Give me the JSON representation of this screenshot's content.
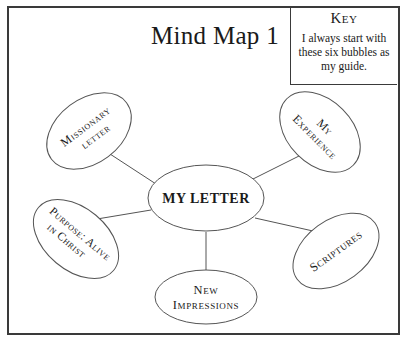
{
  "title": "Mind Map 1",
  "key": {
    "heading": "Key",
    "text": "I always start with these six bubbles as my guide."
  },
  "center_node": {
    "label": "MY LETTER"
  },
  "nodes": [
    {
      "id": "missionary",
      "line1": "Missionary",
      "line2": "letter"
    },
    {
      "id": "experience",
      "line1": "My",
      "line2": "Experience"
    },
    {
      "id": "purpose",
      "line1": "Purpose: Alive",
      "line2": "in Christ"
    },
    {
      "id": "scriptures",
      "line1": "Scriptures",
      "line2": ""
    },
    {
      "id": "impressions",
      "line1": "New",
      "line2": "Impressions"
    }
  ],
  "colors": {
    "stroke": "#555555",
    "text": "#1a1a1a",
    "border": "#3a3a3a"
  }
}
